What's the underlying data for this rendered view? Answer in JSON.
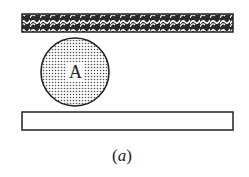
{
  "diagram": {
    "top_plate": {
      "pattern": "hatched-weave",
      "fill": "#333333"
    },
    "ball": {
      "label": "A",
      "pattern": "dotted",
      "fill": "#888888"
    },
    "bottom_plate": {
      "pattern": "none",
      "fill": "#ffffff"
    },
    "caption": {
      "prefix": "(",
      "letter": "a",
      "suffix": ")"
    }
  }
}
